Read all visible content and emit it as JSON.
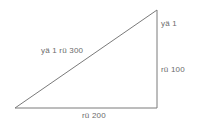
{
  "figure": {
    "type": "right-triangle-diagram",
    "background_color": "#ffffff",
    "stroke_color": "#7a7a7a",
    "text_color": "#6b6b6b",
    "stroke_width": 1,
    "vertices": {
      "bottom_left": [
        15,
        108
      ],
      "bottom_right": [
        157,
        108
      ],
      "top_right": [
        157,
        10
      ]
    }
  },
  "labels": {
    "hypotenuse": "yä 1 rü 300",
    "vertical_top": "yä 1",
    "vertical_bottom": "rü 100",
    "base": "rü 200"
  }
}
